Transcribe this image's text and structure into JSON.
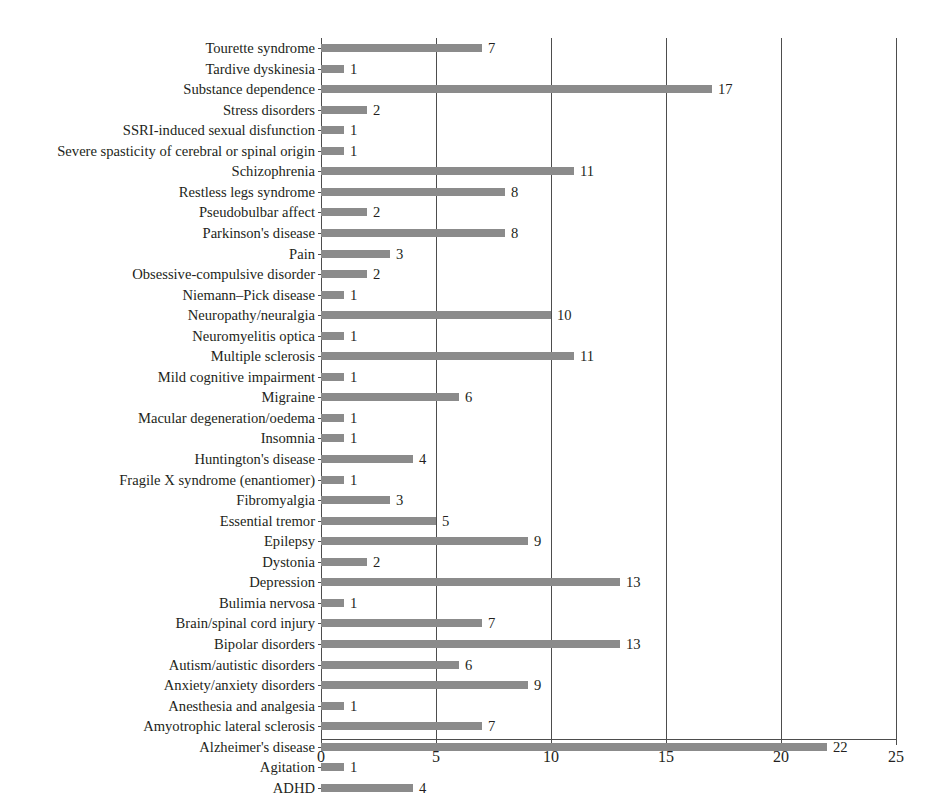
{
  "chart_data": {
    "type": "bar",
    "orientation": "horizontal",
    "title": "",
    "subtitle": "",
    "xlabel": "",
    "ylabel": "",
    "xlim": [
      0,
      25
    ],
    "xticks": [
      0,
      5,
      10,
      15,
      20,
      25
    ],
    "grid": "vertical gridlines at each x tick",
    "legend": "none",
    "bar_color": "#8b8b8b",
    "axis_color": "#4d4d4d",
    "text_color": "#231f20",
    "value_labels_shown": true,
    "categories": [
      "Tourette syndrome",
      "Tardive dyskinesia",
      "Substance dependence",
      "Stress disorders",
      "SSRI-induced sexual disfunction",
      "Severe spasticity of cerebral or spinal origin",
      "Schizophrenia",
      "Restless legs syndrome",
      "Pseudobulbar affect",
      "Parkinson's disease",
      "Pain",
      "Obsessive-compulsive disorder",
      "Niemann–Pick disease",
      "Neuropathy/neuralgia",
      "Neuromyelitis optica",
      "Multiple sclerosis",
      "Mild cognitive impairment",
      "Migraine",
      "Macular degeneration/oedema",
      "Insomnia",
      "Huntington's disease",
      "Fragile X syndrome (enantiomer)",
      "Fibromyalgia",
      "Essential tremor",
      "Epilepsy",
      "Dystonia",
      "Depression",
      "Bulimia nervosa",
      "Brain/spinal cord injury",
      "Bipolar disorders",
      "Autism/autistic disorders",
      "Anxiety/anxiety disorders",
      "Anesthesia and analgesia",
      "Amyotrophic lateral sclerosis",
      "Alzheimer's disease",
      "Agitation",
      "ADHD"
    ],
    "values": [
      7,
      1,
      17,
      2,
      1,
      1,
      11,
      8,
      2,
      8,
      3,
      2,
      1,
      10,
      1,
      11,
      1,
      6,
      1,
      1,
      4,
      1,
      3,
      5,
      9,
      2,
      13,
      1,
      7,
      13,
      6,
      9,
      1,
      7,
      22,
      1,
      4
    ]
  }
}
